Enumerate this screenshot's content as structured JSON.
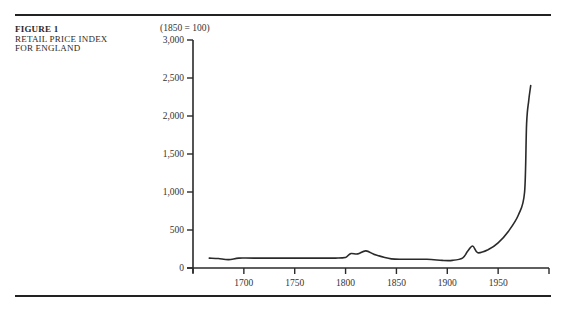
{
  "figure": {
    "number": "FIGURE 1",
    "title_line1": "RETAIL PRICE INDEX",
    "title_line2": "FOR ENGLAND"
  },
  "chart_data": {
    "type": "line",
    "title": "Retail Price Index for England",
    "ylabel": "(1850 = 100)",
    "xlabel": "",
    "xlim": [
      1650,
      2000
    ],
    "ylim": [
      0,
      3000
    ],
    "grid": false,
    "legend": null,
    "x_ticks": [
      1650,
      1700,
      1750,
      1800,
      1850,
      1900,
      1950,
      2000
    ],
    "x_tick_labels": [
      "",
      "1700",
      "1750",
      "1800",
      "1850",
      "1900",
      "1950",
      ""
    ],
    "y_ticks": [
      0,
      500,
      1000,
      1500,
      2000,
      2500,
      3000
    ],
    "y_tick_labels": [
      "0",
      "500",
      "1,000",
      "1,500",
      "2,000",
      "2,500",
      "3,000"
    ],
    "series": [
      {
        "name": "Retail Price Index",
        "x": [
          1666,
          1675,
          1685,
          1695,
          1710,
          1750,
          1790,
          1800,
          1805,
          1812,
          1820,
          1830,
          1845,
          1860,
          1880,
          1895,
          1905,
          1915,
          1920,
          1925,
          1930,
          1940,
          1950,
          1960,
          1970,
          1976,
          1978,
          1980,
          1982
        ],
        "y": [
          130,
          125,
          110,
          130,
          130,
          130,
          130,
          140,
          190,
          185,
          225,
          170,
          120,
          115,
          115,
          100,
          100,
          130,
          220,
          290,
          200,
          240,
          330,
          480,
          700,
          1000,
          1900,
          2200,
          2400
        ]
      }
    ]
  }
}
